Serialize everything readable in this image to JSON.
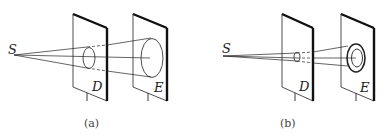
{
  "panels": [
    {
      "id": "a",
      "caption": "(a)",
      "source_label": "S",
      "screen_d_label": "D",
      "screen_e_label": "E",
      "description": "Point source S illuminates a circular hole in screen D; a cone of light projects a large ellipse onto screen E (geometric shadow)."
    },
    {
      "id": "b",
      "caption": "(b)",
      "source_label": "S",
      "screen_d_label": "D",
      "screen_e_label": "E",
      "description": "Point source S illuminates a small hole in screen D; concentric diffraction rings appear on screen E."
    }
  ],
  "colors": {
    "line": "#222222",
    "background": "#ffffff"
  }
}
